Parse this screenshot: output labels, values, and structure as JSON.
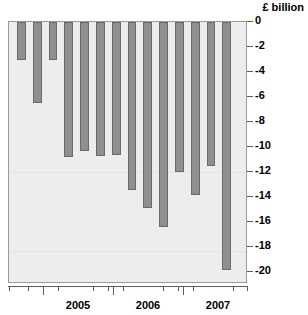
{
  "chart_data": {
    "type": "bar",
    "title": "",
    "subtitle": "",
    "unit_caption": "£ billion",
    "xlabel": "",
    "ylabel": "£ billion",
    "ylim": [
      -20.8,
      0
    ],
    "ytick_values": [
      0,
      -2,
      -4,
      -6,
      -8,
      -10,
      -12,
      -14,
      -16,
      -18,
      -20
    ],
    "ytick_labels": [
      "0",
      "-2",
      "-4",
      "-6",
      "-8",
      "-10",
      "-12",
      "-14",
      "-16",
      "-18",
      "-20"
    ],
    "grid": false,
    "legend": "none",
    "bar_color": "#8f8f8f",
    "bar_edge_color": "#6a6a6a",
    "plot_background": "#ededed",
    "categories": [
      "2004 Q1",
      "2004 Q2",
      "2004 Q3",
      "2004 Q4",
      "2005 Q1",
      "2005 Q2",
      "2005 Q3",
      "2005 Q4",
      "2006 Q1",
      "2006 Q2",
      "2006 Q3",
      "2006 Q4",
      "2007 Q1",
      "2007 Q2"
    ],
    "values": [
      -3.0,
      -6.5,
      -3.0,
      -10.8,
      -10.3,
      -10.7,
      -10.6,
      -13.4,
      -14.9,
      -16.4,
      -12.0,
      -13.8,
      -11.5,
      -19.8
    ],
    "x_major_ticks": [
      {
        "label": "2005",
        "position": 0.2917
      },
      {
        "label": "2006",
        "position": 0.5833
      },
      {
        "label": "2007",
        "position": 0.875
      }
    ],
    "x_minor_tick_positions": [
      0.0042,
      0.0833,
      0.1458,
      0.2083,
      0.3542,
      0.4167,
      0.4792,
      0.6458,
      0.7083,
      0.7708,
      0.9375,
      0.9958
    ]
  }
}
